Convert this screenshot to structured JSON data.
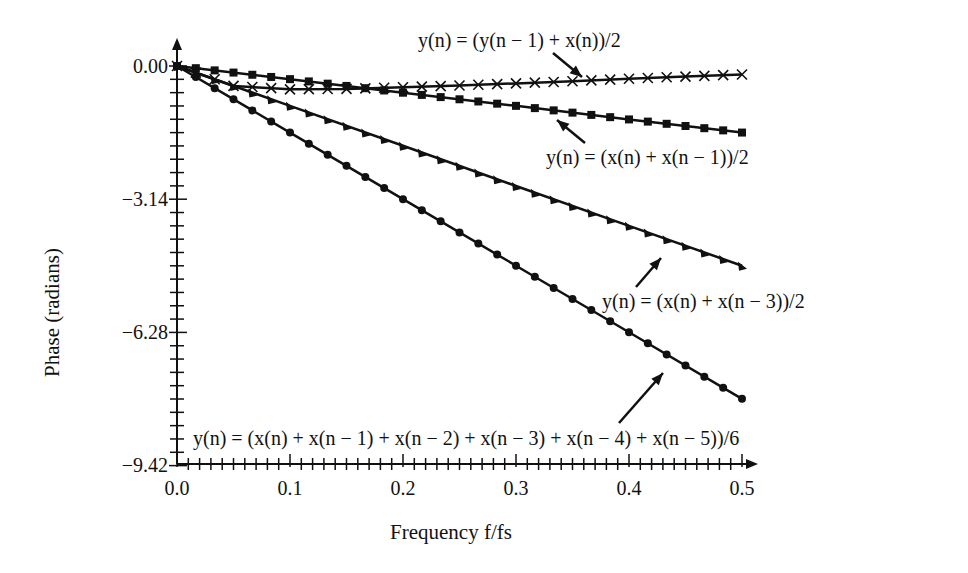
{
  "chart_data": {
    "type": "line",
    "title": "",
    "xlabel": "Frequency f/fs",
    "ylabel": "Phase (radians)",
    "xlim": [
      0,
      0.5
    ],
    "ylim": [
      -9.42,
      0
    ],
    "x_ticks": [
      "0.0",
      "0.1",
      "0.2",
      "0.3",
      "0.4",
      "0.5"
    ],
    "y_ticks": [
      "0.00",
      "−3.14",
      "−6.28",
      "−9.42"
    ],
    "grid": false,
    "legend_position": "inline annotations with arrows",
    "series": [
      {
        "name": "y(n) = (y(n − 1) + x(n))/2",
        "marker": "x",
        "x": [
          0,
          0.05,
          0.1,
          0.15,
          0.2,
          0.25,
          0.3,
          0.35,
          0.4,
          0.45,
          0.5
        ],
        "values": [
          0,
          -0.47,
          -0.55,
          -0.54,
          -0.5,
          -0.46,
          -0.41,
          -0.36,
          -0.3,
          -0.25,
          -0.2
        ]
      },
      {
        "name": "y(n) = (x(n) + x(n − 1))/2",
        "marker": "square",
        "x": [
          0,
          0.1,
          0.2,
          0.3,
          0.4,
          0.5
        ],
        "values": [
          0,
          -0.31,
          -0.63,
          -0.94,
          -1.26,
          -1.57
        ]
      },
      {
        "name": "y(n) = (x(n) + x(n − 3))/2",
        "marker": "triangle",
        "x": [
          0,
          0.1,
          0.2,
          0.3,
          0.4,
          0.5
        ],
        "values": [
          0,
          -0.94,
          -1.88,
          -2.83,
          -3.77,
          -4.71
        ]
      },
      {
        "name": "y(n) = (x(n) + x(n − 1) + x(n − 2) + x(n − 3) + x(n − 4) + x(n − 5))/6",
        "marker": "circle",
        "x": [
          0,
          0.1,
          0.2,
          0.3,
          0.4,
          0.5
        ],
        "values": [
          0,
          -1.57,
          -3.14,
          -4.71,
          -6.28,
          -7.85
        ]
      }
    ]
  },
  "labels": {
    "s1": "y(n) = (y(n − 1) + x(n))/2",
    "s2": "y(n) = (x(n) + x(n − 1))/2",
    "s3": "y(n) = (x(n) + x(n − 3))/2",
    "s4": "y(n) = (x(n) + x(n − 1) + x(n − 2) + x(n − 3) + x(n − 4) + x(n − 5))/6",
    "xlabel": "Frequency f/fs",
    "ylabel": "Phase (radians)",
    "y0": "0.00",
    "y1": "−3.14",
    "y2": "−6.28",
    "y3": "−9.42",
    "x0": "0.0",
    "x1": "0.1",
    "x2": "0.2",
    "x3": "0.3",
    "x4": "0.4",
    "x5": "0.5"
  }
}
